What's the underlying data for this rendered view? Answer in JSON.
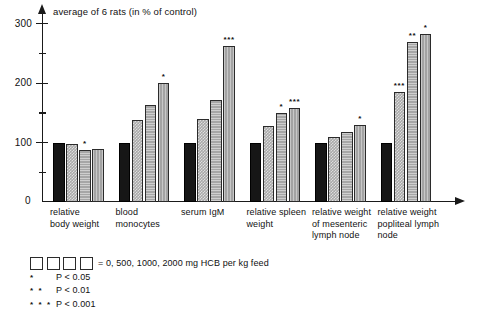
{
  "chart_data": {
    "type": "bar",
    "title": "average of 6 rats (in % of control)",
    "xlabel": "",
    "ylabel": "",
    "ylim": [
      0,
      320
    ],
    "grid": false,
    "legend_position": "below-plot",
    "y_ticks_major": [
      100,
      200,
      300
    ],
    "y_ticks_minor": [
      50,
      150,
      250
    ],
    "y_axis_origin_label": "0",
    "categories": [
      "relative\nbody weight",
      "blood\nmonocytes",
      "serum IgM",
      "relative spleen\nweight",
      "relative weight\nof mesenteric\nlymph node",
      "relative weight\npopliteal lymph\nnode"
    ],
    "series": [
      {
        "name": "0 mg HCB per kg feed",
        "values": [
          100,
          100,
          100,
          100,
          100,
          100
        ]
      },
      {
        "name": "500 mg HCB per kg feed",
        "values": [
          97,
          138,
          140,
          128,
          110,
          185
        ]
      },
      {
        "name": "1000 mg HCB per kg feed",
        "values": [
          88,
          163,
          172,
          150,
          118,
          270
        ]
      },
      {
        "name": "2000 mg HCB per kg feed",
        "values": [
          90,
          200,
          262,
          158,
          130,
          283
        ]
      }
    ],
    "significance": [
      [
        "",
        "",
        "*",
        ""
      ],
      [
        "",
        "",
        "",
        "*"
      ],
      [
        "",
        "",
        "",
        "***"
      ],
      [
        "",
        "",
        "*",
        "***"
      ],
      [
        "",
        "",
        "",
        "*"
      ],
      [
        "",
        "***",
        "**",
        "*"
      ]
    ],
    "annotations": {
      "legend_series_label": "= 0, 500, 1000, 2000 mg HCB per kg feed",
      "sig_levels": [
        {
          "stars": "*",
          "text": "P < 0.05"
        },
        {
          "stars": "* *",
          "text": "P < 0.01"
        },
        {
          "stars": "* * *",
          "text": "P < 0.001"
        }
      ]
    },
    "colors": {
      "series_0": "#161616",
      "series_1": "#a9a9a9",
      "series_2": "#a6a6a6",
      "series_3": "#a3a3a3",
      "axis": "#1a1a1a",
      "background": "#ffffff"
    }
  }
}
